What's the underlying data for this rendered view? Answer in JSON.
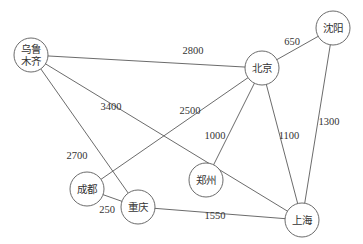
{
  "diagram": {
    "type": "weighted-undirected-graph",
    "nodes": [
      {
        "id": "urumqi",
        "label_lines": [
          "乌鲁",
          "木齐"
        ],
        "x": 31,
        "y": 55,
        "r": 17
      },
      {
        "id": "beijing",
        "label_lines": [
          "北京"
        ],
        "x": 262,
        "y": 68,
        "r": 17
      },
      {
        "id": "shenyang",
        "label_lines": [
          "沈阳"
        ],
        "x": 333,
        "y": 28,
        "r": 17
      },
      {
        "id": "chengdu",
        "label_lines": [
          "成都"
        ],
        "x": 87,
        "y": 189,
        "r": 17
      },
      {
        "id": "chongqing",
        "label_lines": [
          "重庆"
        ],
        "x": 138,
        "y": 207,
        "r": 17
      },
      {
        "id": "zhengzhou",
        "label_lines": [
          "郑州"
        ],
        "x": 206,
        "y": 180,
        "r": 17
      },
      {
        "id": "shanghai",
        "label_lines": [
          "上海"
        ],
        "x": 302,
        "y": 220,
        "r": 17
      }
    ],
    "edges": [
      {
        "from": "urumqi",
        "to": "beijing",
        "weight": "2800",
        "lx": 193,
        "ly": 50
      },
      {
        "from": "urumqi",
        "to": "shanghai",
        "weight": "3400",
        "lx": 111,
        "ly": 106
      },
      {
        "from": "urumqi",
        "to": "chongqing",
        "weight": "2700",
        "lx": 77,
        "ly": 155
      },
      {
        "from": "beijing",
        "to": "shenyang",
        "weight": "650",
        "lx": 292,
        "ly": 41
      },
      {
        "from": "beijing",
        "to": "chengdu",
        "weight": "2500",
        "lx": 190,
        "ly": 110
      },
      {
        "from": "beijing",
        "to": "zhengzhou",
        "weight": "1000",
        "lx": 215,
        "ly": 135
      },
      {
        "from": "beijing",
        "to": "shanghai",
        "weight": "1100",
        "lx": 289,
        "ly": 135
      },
      {
        "from": "shenyang",
        "to": "shanghai",
        "weight": "1300",
        "lx": 329,
        "ly": 121
      },
      {
        "from": "chengdu",
        "to": "chongqing",
        "weight": "250",
        "lx": 107,
        "ly": 209
      },
      {
        "from": "chongqing",
        "to": "shanghai",
        "weight": "1550",
        "lx": 215,
        "ly": 215
      }
    ]
  },
  "colors": {
    "stroke": "#5a5a5a",
    "text": "#333333",
    "background": "#ffffff"
  }
}
